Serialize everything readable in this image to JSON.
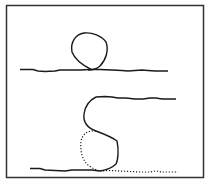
{
  "figure": {
    "panels": [
      {
        "name": "top",
        "elements": [
          "wavy-baseline",
          "loop"
        ]
      },
      {
        "name": "bottom",
        "elements": [
          "upper-wavy-line",
          "s-curve",
          "dotted-loop",
          "lower-wavy-line",
          "dotted-baseline-tail"
        ]
      }
    ],
    "stroke_color": "#1a1a1a",
    "frame_color": "#333333"
  }
}
